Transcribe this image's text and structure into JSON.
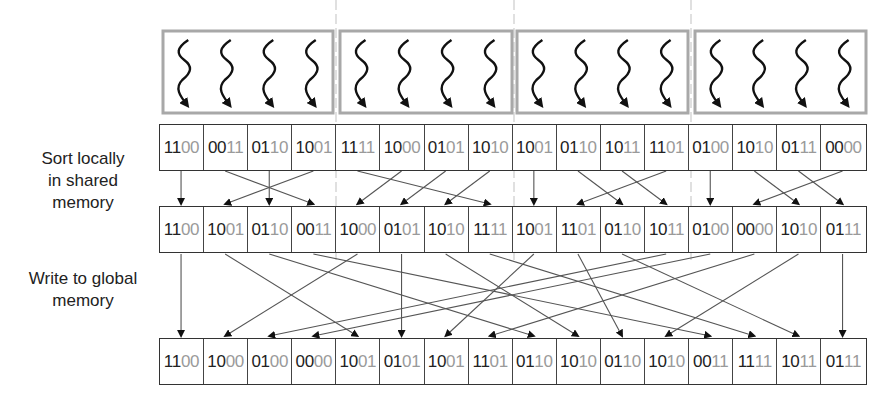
{
  "labels": {
    "sort_locally": [
      "Sort locally",
      "in shared",
      "memory"
    ],
    "write_global": [
      "Write to global",
      "memory"
    ]
  },
  "thread_blocks": {
    "count": 4,
    "threads_per_block": 4
  },
  "rows": {
    "input": [
      "1100",
      "0011",
      "0110",
      "1001",
      "1111",
      "1000",
      "0101",
      "1010",
      "1001",
      "0110",
      "1011",
      "1101",
      "0100",
      "1010",
      "0111",
      "0000"
    ],
    "locally_sorted": [
      "1100",
      "1001",
      "0110",
      "0011",
      "1000",
      "0101",
      "1010",
      "1111",
      "1001",
      "1101",
      "0110",
      "1011",
      "0100",
      "0000",
      "1010",
      "0111"
    ],
    "global_output": [
      "1100",
      "1000",
      "0100",
      "0000",
      "1001",
      "0101",
      "1001",
      "1101",
      "0110",
      "1010",
      "0110",
      "1010",
      "0011",
      "1111",
      "1011",
      "0111"
    ]
  },
  "mappings": {
    "input_to_local": [
      0,
      3,
      2,
      1,
      7,
      4,
      5,
      6,
      8,
      10,
      11,
      9,
      12,
      14,
      15,
      13
    ],
    "local_to_global": [
      0,
      4,
      8,
      12,
      1,
      5,
      9,
      13,
      6,
      10,
      14,
      2,
      3,
      7,
      11,
      15
    ]
  },
  "colors": {
    "high_bits": "#222222",
    "low_bits": "#9a9a9a",
    "block_border": "#a8a8a8",
    "arrow": "#555555",
    "separator": "#cccccc"
  }
}
